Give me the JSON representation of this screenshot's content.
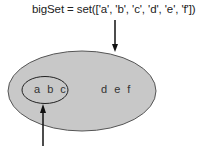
{
  "diagram": {
    "code_label": "bigSet = set(['a', 'b', 'c', 'd', 'e', 'f'])",
    "outer_set": {
      "label": "d e f",
      "fill": "#c8c8c8",
      "stroke": "#444444"
    },
    "inner_set": {
      "label": "a b c",
      "fill": "#c8c8c8",
      "stroke": "#222222"
    },
    "arrow_color": "#111111"
  }
}
